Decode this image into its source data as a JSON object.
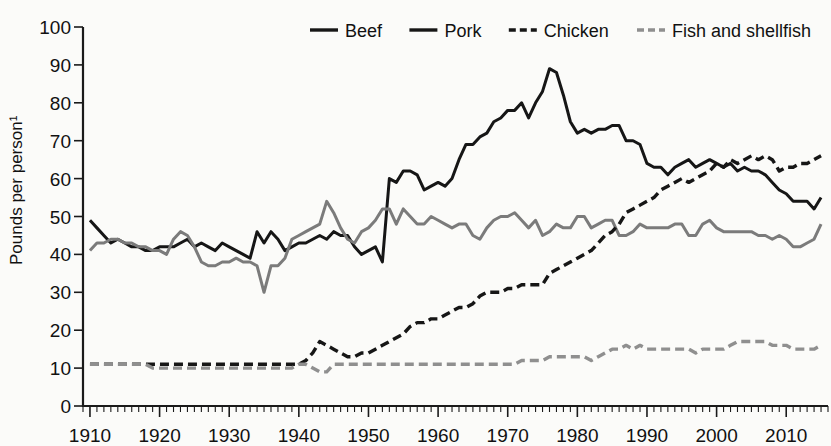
{
  "chart_data": {
    "type": "line",
    "title": "",
    "xlabel": "",
    "ylabel": "Pounds per person¹",
    "xlim": [
      1909,
      2016
    ],
    "ylim": [
      0,
      100
    ],
    "ytick_labels": [
      "0",
      "10",
      "20",
      "30",
      "40",
      "50",
      "60",
      "70",
      "80",
      "90",
      "100"
    ],
    "ytick_values": [
      0,
      10,
      20,
      30,
      40,
      50,
      60,
      70,
      80,
      90,
      100
    ],
    "xtick_labels": [
      "1910",
      "1920",
      "1930",
      "1940",
      "1950",
      "1960",
      "1970",
      "1980",
      "1990",
      "2000",
      "2010"
    ],
    "xtick_values": [
      1910,
      1920,
      1930,
      1940,
      1950,
      1960,
      1970,
      1980,
      1990,
      2000,
      2010
    ],
    "grid": false,
    "minor_ticks": "annual",
    "legend_position": "top-center",
    "x": [
      1910,
      1911,
      1912,
      1913,
      1914,
      1915,
      1916,
      1917,
      1918,
      1919,
      1920,
      1921,
      1922,
      1923,
      1924,
      1925,
      1926,
      1927,
      1928,
      1929,
      1930,
      1931,
      1932,
      1933,
      1934,
      1935,
      1936,
      1937,
      1938,
      1939,
      1940,
      1941,
      1942,
      1943,
      1944,
      1945,
      1946,
      1947,
      1948,
      1949,
      1950,
      1951,
      1952,
      1953,
      1954,
      1955,
      1956,
      1957,
      1958,
      1959,
      1960,
      1961,
      1962,
      1963,
      1964,
      1965,
      1966,
      1967,
      1968,
      1969,
      1970,
      1971,
      1972,
      1973,
      1974,
      1975,
      1976,
      1977,
      1978,
      1979,
      1980,
      1981,
      1982,
      1983,
      1984,
      1985,
      1986,
      1987,
      1988,
      1989,
      1990,
      1991,
      1992,
      1993,
      1994,
      1995,
      1996,
      1997,
      1998,
      1999,
      2000,
      2001,
      2002,
      2003,
      2004,
      2005,
      2006,
      2007,
      2008,
      2009,
      2010,
      2011,
      2012,
      2013,
      2014,
      2015
    ],
    "series": [
      {
        "name": "Beef",
        "color": "#161616",
        "style": "solid",
        "values": [
          49,
          47,
          45,
          43,
          44,
          43,
          42,
          42,
          41,
          41,
          42,
          42,
          42,
          43,
          44,
          42,
          43,
          42,
          41,
          43,
          42,
          41,
          40,
          39,
          46,
          43,
          46,
          44,
          41,
          42,
          43,
          43,
          44,
          45,
          44,
          46,
          45,
          45,
          42,
          40,
          41,
          42,
          38,
          60,
          59,
          62,
          62,
          61,
          57,
          58,
          59,
          58,
          60,
          65,
          69,
          69,
          71,
          72,
          75,
          76,
          78,
          78,
          80,
          76,
          80,
          83,
          89,
          88,
          82,
          75,
          72,
          73,
          72,
          73,
          73,
          74,
          74,
          70,
          70,
          69,
          64,
          63,
          63,
          61,
          63,
          64,
          65,
          63,
          64,
          65,
          64,
          63,
          64,
          62,
          63,
          62,
          62,
          61,
          59,
          57,
          56,
          54,
          54,
          54,
          52,
          55
        ]
      },
      {
        "name": "Pork",
        "color": "#7b7b7b",
        "style": "solid",
        "values": [
          41,
          43,
          43,
          44,
          44,
          43,
          43,
          42,
          42,
          41,
          41,
          40,
          44,
          46,
          45,
          42,
          38,
          37,
          37,
          38,
          38,
          39,
          38,
          38,
          37,
          30,
          37,
          37,
          39,
          44,
          45,
          46,
          47,
          48,
          54,
          51,
          47,
          44,
          43,
          46,
          47,
          49,
          52,
          52,
          48,
          52,
          50,
          48,
          48,
          50,
          49,
          48,
          47,
          48,
          48,
          45,
          44,
          47,
          49,
          50,
          50,
          51,
          49,
          47,
          49,
          45,
          46,
          48,
          47,
          47,
          50,
          50,
          47,
          48,
          49,
          49,
          45,
          45,
          46,
          48,
          47,
          47,
          47,
          47,
          48,
          48,
          45,
          45,
          48,
          49,
          47,
          46,
          46,
          46,
          46,
          46,
          45,
          45,
          44,
          45,
          44,
          42,
          42,
          43,
          44,
          48
        ]
      },
      {
        "name": "Chicken",
        "color": "#161616",
        "style": "dashed",
        "values": [
          11,
          11,
          11,
          11,
          11,
          11,
          11,
          11,
          11,
          11,
          11,
          11,
          11,
          11,
          11,
          11,
          11,
          11,
          11,
          11,
          11,
          11,
          11,
          11,
          11,
          11,
          11,
          11,
          11,
          11,
          11,
          12,
          14,
          17,
          16,
          15,
          14,
          13,
          13,
          14,
          14,
          15,
          16,
          17,
          18,
          19,
          21,
          22,
          22,
          23,
          23,
          24,
          25,
          26,
          26,
          27,
          29,
          30,
          30,
          30,
          31,
          31,
          32,
          32,
          32,
          32,
          35,
          36,
          37,
          38,
          39,
          40,
          41,
          43,
          45,
          46,
          48,
          51,
          52,
          53,
          54,
          55,
          57,
          58,
          59,
          60,
          59,
          60,
          61,
          62,
          64,
          63,
          65,
          64,
          65,
          66,
          65,
          66,
          65,
          62,
          63,
          63,
          64,
          64,
          65,
          66
        ]
      },
      {
        "name": "Fish and shellfish",
        "color": "#8f8f8f",
        "style": "dashed",
        "values": [
          11,
          11,
          11,
          11,
          11,
          11,
          11,
          11,
          11,
          10,
          10,
          10,
          10,
          10,
          10,
          10,
          10,
          10,
          10,
          10,
          10,
          10,
          10,
          10,
          10,
          10,
          10,
          10,
          10,
          10,
          11,
          11,
          10,
          9,
          9,
          11,
          11,
          11,
          11,
          11,
          11,
          11,
          11,
          11,
          11,
          11,
          11,
          11,
          11,
          11,
          11,
          11,
          11,
          11,
          11,
          11,
          11,
          11,
          11,
          11,
          11,
          11,
          12,
          12,
          12,
          12,
          13,
          13,
          13,
          13,
          13,
          13,
          12,
          13,
          14,
          15,
          15,
          16,
          15,
          16,
          15,
          15,
          15,
          15,
          15,
          15,
          15,
          14,
          15,
          15,
          15,
          15,
          16,
          17,
          17,
          17,
          17,
          17,
          16,
          16,
          16,
          15,
          15,
          15,
          15,
          16
        ]
      }
    ]
  },
  "legend": {
    "items": [
      {
        "label": "Beef",
        "color": "#161616",
        "style": "solid"
      },
      {
        "label": "Pork",
        "color": "#161616",
        "style": "solid"
      },
      {
        "label": "Chicken",
        "color": "#161616",
        "style": "dashed"
      },
      {
        "label": "Fish and shellfish",
        "color": "#8f8f8f",
        "style": "dashed"
      }
    ]
  }
}
